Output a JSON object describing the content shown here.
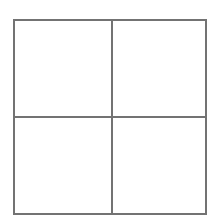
{
  "figure": {
    "background_color": "#ffffff",
    "line_color": "#737373",
    "line_width_px": 2,
    "canvas": {
      "width_px": 214,
      "height_px": 223
    },
    "outer_square": {
      "name": "outer square",
      "left_px": 13,
      "top_px": 19,
      "right_px": 207,
      "bottom_px": 215,
      "width_px": 194,
      "height_px": 196
    },
    "dividers": [
      {
        "name": "vertical divider",
        "orientation": "vertical",
        "position_px": 111
      },
      {
        "name": "horizontal divider",
        "orientation": "horizontal",
        "position_px": 116
      }
    ],
    "quadrants": [
      {
        "name": "top-left",
        "label": ""
      },
      {
        "name": "top-right",
        "label": ""
      },
      {
        "name": "bottom-left",
        "label": ""
      },
      {
        "name": "bottom-right",
        "label": ""
      }
    ]
  }
}
